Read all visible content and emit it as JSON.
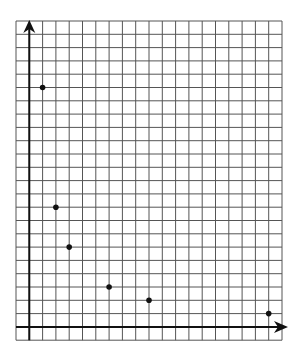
{
  "chart_data": {
    "type": "scatter",
    "title": "",
    "xlabel": "",
    "ylabel": "",
    "x": [
      1,
      2,
      3,
      6,
      9,
      18
    ],
    "y": [
      18,
      9,
      6,
      3,
      2,
      1
    ],
    "series": [
      {
        "name": "points",
        "x": [
          1,
          2,
          3,
          6,
          9,
          18
        ],
        "y": [
          18,
          9,
          6,
          3,
          2,
          1
        ]
      }
    ],
    "xlim": [
      -1,
      19
    ],
    "ylim": [
      -1,
      23
    ],
    "grid": true,
    "tick_labels": false,
    "legend": null,
    "axes_arrows": true
  },
  "style": {
    "grid_color": "#555555",
    "axis_color": "#111111",
    "point_color": "#111111",
    "background": "#ffffff"
  },
  "layout": {
    "grid_left": 16,
    "grid_top": 21,
    "cell": 13.3,
    "cols": 20,
    "rows": 24,
    "origin_col": 1,
    "origin_row_from_bottom": 1
  }
}
